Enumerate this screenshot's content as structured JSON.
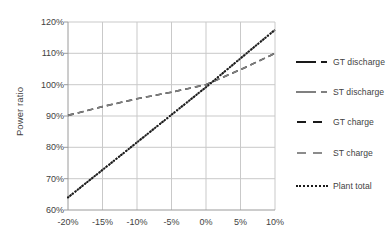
{
  "chart_data": {
    "type": "line",
    "title": "",
    "xlabel": "",
    "ylabel": "Power ratio",
    "xlim": [
      -20,
      10
    ],
    "ylim": [
      60,
      120
    ],
    "xtick_labels": [
      "-20%",
      "-15%",
      "-10%",
      "-5%",
      "0%",
      "5%",
      "10%"
    ],
    "xtick_values": [
      -20,
      -15,
      -10,
      -5,
      0,
      5,
      10
    ],
    "ytick_labels": [
      "60%",
      "70%",
      "80%",
      "90%",
      "100%",
      "110%",
      "120%"
    ],
    "ytick_values": [
      60,
      70,
      80,
      90,
      100,
      110,
      120
    ],
    "grid": true,
    "legend_position": "right",
    "x": [
      -20,
      -15,
      -10,
      -5,
      0,
      5,
      10
    ],
    "series": [
      {
        "name": "GT discharge",
        "color": "#1a1a1a",
        "dash": "dashdot",
        "values": [
          64.0,
          72.8,
          81.6,
          90.4,
          99.2,
          108.4,
          117.5
        ]
      },
      {
        "name": "ST discharge",
        "color": "#7f7f7f",
        "dash": "dashdot",
        "values": [
          64.0,
          72.8,
          81.6,
          90.4,
          99.2,
          108.4,
          117.5
        ]
      },
      {
        "name": "GT charge",
        "color": "#1a1a1a",
        "dash": "dashed",
        "values": [
          90.2,
          93.0,
          95.5,
          97.6,
          100.0,
          104.8,
          110.0
        ]
      },
      {
        "name": "ST charge",
        "color": "#7f7f7f",
        "dash": "dashed",
        "values": [
          90.2,
          93.0,
          95.5,
          97.6,
          100.0,
          104.8,
          110.0
        ]
      },
      {
        "name": "Plant total",
        "color": "#1a1a1a",
        "dash": "dotted",
        "values": [
          64.0,
          72.8,
          81.6,
          90.4,
          99.2,
          108.4,
          117.5
        ]
      }
    ]
  },
  "axis": {
    "y_title": "Power ratio",
    "y_ticks": [
      "120%",
      "110%",
      "100%",
      "90%",
      "80%",
      "70%",
      "60%"
    ],
    "x_ticks": [
      "-20%",
      "-15%",
      "-10%",
      "-5%",
      "0%",
      "5%",
      "10%"
    ]
  },
  "legend": {
    "entries": [
      {
        "label": "GT discharge",
        "color": "#1a1a1a",
        "style": "dashdot"
      },
      {
        "label": "ST discharge",
        "color": "#808080",
        "style": "dashdot"
      },
      {
        "label": "GT charge",
        "color": "#1a1a1a",
        "style": "dashed"
      },
      {
        "label": "ST charge",
        "color": "#8c8c8c",
        "style": "dashed"
      },
      {
        "label": "Plant total",
        "color": "#1a1a1a",
        "style": "dotted"
      }
    ]
  },
  "colors": {
    "grid": "#c9c9c9",
    "axis": "#9a9a9a",
    "text": "#3f3f3f",
    "background": "#ffffff",
    "black_series": "#1a1a1a",
    "gray_series": "#808080"
  }
}
